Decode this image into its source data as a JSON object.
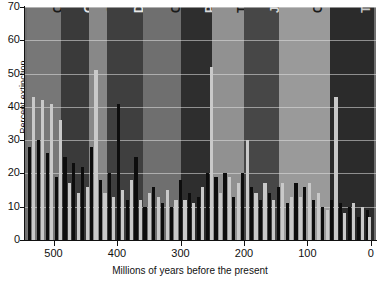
{
  "chart_data": {
    "type": "bar",
    "title": "",
    "xlabel": "Millions of years before the present",
    "ylabel": "Percent extinction",
    "xlim": [
      545,
      -8
    ],
    "ylim": [
      0,
      70
    ],
    "xticks": [
      500,
      400,
      300,
      200,
      100,
      0
    ],
    "yticks": [
      0,
      10,
      20,
      30,
      40,
      50,
      60,
      70
    ],
    "grid": "horizontal",
    "legend": "none",
    "x_axis_direction": "reversed",
    "bands": [
      {
        "label": "Cambrian",
        "start": 542,
        "end": 488,
        "fill": "#777777",
        "text": "#1a1a1a"
      },
      {
        "label": "Ordovician",
        "start": 488,
        "end": 444,
        "fill": "#3a3a3a",
        "text": "#e8e8e8"
      },
      {
        "label": "Silurian",
        "start": 444,
        "end": 416,
        "fill": "#888888",
        "text": "#1a1a1a"
      },
      {
        "label": "Devonian",
        "start": 416,
        "end": 359,
        "fill": "#3f3f3f",
        "text": "#e8e8e8"
      },
      {
        "label": "Carboniferous",
        "start": 359,
        "end": 299,
        "fill": "#6f6f6f",
        "text": "#1a1a1a"
      },
      {
        "label": "Permian",
        "start": 299,
        "end": 251,
        "fill": "#2e2e2e",
        "text": "#d8d8d8"
      },
      {
        "label": "Triassic",
        "start": 251,
        "end": 200,
        "fill": "#919191",
        "text": "#1a1a1a"
      },
      {
        "label": "Jurassic",
        "start": 200,
        "end": 145,
        "fill": "#474747",
        "text": "#d8d8d8"
      },
      {
        "label": "Cretaceous",
        "start": 145,
        "end": 65,
        "fill": "#9a9a9a",
        "text": "#1a1a1a"
      },
      {
        "label": "Tertiary",
        "start": 65,
        "end": -5,
        "fill": "#2b2b2b",
        "text": "#c8c8c8"
      }
    ],
    "bar_colors": {
      "light": "#c9c9c9",
      "dark": "#0d0d0d"
    },
    "categories": [
      538,
      531,
      524,
      517,
      510,
      503,
      496,
      489,
      482,
      475,
      468,
      461,
      454,
      447,
      440,
      433,
      426,
      419,
      412,
      405,
      398,
      391,
      384,
      377,
      370,
      363,
      356,
      349,
      342,
      335,
      328,
      321,
      314,
      307,
      300,
      293,
      286,
      279,
      272,
      265,
      258,
      251,
      244,
      237,
      230,
      223,
      216,
      209,
      202,
      195,
      188,
      181,
      174,
      167,
      160,
      153,
      146,
      139,
      132,
      125,
      118,
      111,
      104,
      97,
      90,
      83,
      76,
      69,
      62,
      55,
      48,
      41,
      34,
      27,
      20,
      13,
      6,
      2
    ],
    "values": [
      28,
      43,
      30,
      42,
      26,
      41,
      19,
      36,
      25,
      17,
      23,
      14,
      22,
      16,
      28,
      51,
      18,
      14,
      20,
      13,
      41,
      15,
      12,
      18,
      25,
      12,
      10,
      14,
      16,
      13,
      11,
      15,
      10,
      12,
      18,
      12,
      14,
      11,
      13,
      16,
      20,
      52,
      19,
      14,
      20,
      19,
      13,
      17,
      20,
      30,
      16,
      14,
      12,
      17,
      14,
      12,
      16,
      17,
      11,
      13,
      17,
      13,
      16,
      17,
      12,
      14,
      10,
      9,
      12,
      43,
      11,
      8,
      10,
      11,
      7,
      10,
      9,
      7
    ]
  }
}
